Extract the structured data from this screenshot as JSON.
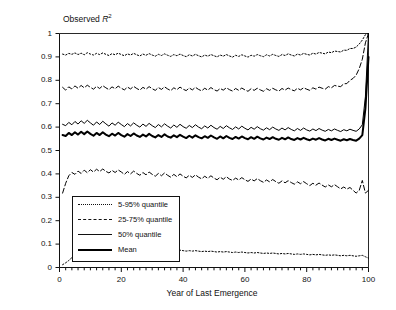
{
  "chart_data": {
    "type": "line",
    "title": "",
    "ylabel": "Observed R2",
    "ylabel_prefix": "Observed ",
    "ylabel_var": "R",
    "ylabel_exp": "2",
    "xlabel": "Year of Last Emergence",
    "xlim": [
      0,
      100
    ],
    "ylim": [
      0,
      1
    ],
    "xticks": [
      0,
      20,
      40,
      60,
      80,
      100
    ],
    "xtick_labels": [
      "0",
      "20",
      "40",
      "60",
      "80",
      "100"
    ],
    "yticks": [
      0,
      0.1,
      0.2,
      0.3,
      0.4,
      0.5,
      0.6,
      0.7,
      0.8,
      0.9,
      1
    ],
    "ytick_labels": [
      "0",
      "0.1",
      "0.2",
      "0.3",
      "0.4",
      "0.5",
      "0.6",
      "0.7",
      "0.8",
      "0.9",
      "1"
    ],
    "grid": false,
    "legend_position": "lower-left-inside",
    "legend": [
      {
        "label": "5-95% quantile",
        "style": "dotted",
        "width": 1
      },
      {
        "label": "25-75% quantile",
        "style": "dashed",
        "width": 1
      },
      {
        "label": "50% quantile",
        "style": "solid",
        "width": 1
      },
      {
        "label": "Mean",
        "style": "solid",
        "width": 2
      }
    ],
    "x": [
      1,
      2,
      3,
      4,
      5,
      6,
      7,
      8,
      9,
      10,
      11,
      12,
      13,
      14,
      15,
      16,
      17,
      18,
      19,
      20,
      21,
      22,
      23,
      24,
      25,
      26,
      27,
      28,
      29,
      30,
      31,
      32,
      33,
      34,
      35,
      36,
      37,
      38,
      39,
      40,
      41,
      42,
      43,
      44,
      45,
      46,
      47,
      48,
      49,
      50,
      51,
      52,
      53,
      54,
      55,
      56,
      57,
      58,
      59,
      60,
      61,
      62,
      63,
      64,
      65,
      66,
      67,
      68,
      69,
      70,
      71,
      72,
      73,
      74,
      75,
      76,
      77,
      78,
      79,
      80,
      81,
      82,
      83,
      84,
      85,
      86,
      87,
      88,
      89,
      90,
      91,
      92,
      93,
      94,
      95,
      96,
      97,
      98,
      99,
      100
    ],
    "series": [
      {
        "name": "95% quantile",
        "style": "dotted",
        "width": 1,
        "values": [
          0.912,
          0.908,
          0.915,
          0.911,
          0.917,
          0.91,
          0.916,
          0.909,
          0.918,
          0.912,
          0.908,
          0.915,
          0.91,
          0.917,
          0.911,
          0.906,
          0.914,
          0.909,
          0.916,
          0.91,
          0.905,
          0.913,
          0.908,
          0.915,
          0.909,
          0.904,
          0.912,
          0.907,
          0.914,
          0.908,
          0.903,
          0.911,
          0.906,
          0.913,
          0.907,
          0.902,
          0.91,
          0.905,
          0.912,
          0.906,
          0.901,
          0.909,
          0.904,
          0.911,
          0.905,
          0.9,
          0.908,
          0.903,
          0.91,
          0.905,
          0.9,
          0.908,
          0.903,
          0.91,
          0.904,
          0.899,
          0.907,
          0.902,
          0.909,
          0.904,
          0.899,
          0.907,
          0.903,
          0.91,
          0.905,
          0.901,
          0.909,
          0.904,
          0.911,
          0.906,
          0.902,
          0.91,
          0.906,
          0.913,
          0.908,
          0.904,
          0.912,
          0.908,
          0.915,
          0.911,
          0.908,
          0.916,
          0.912,
          0.919,
          0.916,
          0.913,
          0.921,
          0.918,
          0.925,
          0.923,
          0.921,
          0.929,
          0.928,
          0.936,
          0.936,
          0.942,
          0.955,
          0.972,
          0.995,
          1.0
        ]
      },
      {
        "name": "75% quantile",
        "style": "dashed",
        "width": 1,
        "values": [
          0.77,
          0.758,
          0.772,
          0.763,
          0.776,
          0.766,
          0.778,
          0.768,
          0.779,
          0.77,
          0.762,
          0.774,
          0.765,
          0.777,
          0.768,
          0.76,
          0.772,
          0.764,
          0.775,
          0.766,
          0.759,
          0.771,
          0.763,
          0.774,
          0.765,
          0.758,
          0.77,
          0.762,
          0.773,
          0.764,
          0.757,
          0.769,
          0.761,
          0.772,
          0.763,
          0.756,
          0.768,
          0.76,
          0.771,
          0.762,
          0.756,
          0.767,
          0.759,
          0.77,
          0.761,
          0.755,
          0.766,
          0.758,
          0.769,
          0.76,
          0.754,
          0.765,
          0.758,
          0.768,
          0.76,
          0.754,
          0.765,
          0.757,
          0.767,
          0.759,
          0.753,
          0.764,
          0.757,
          0.766,
          0.759,
          0.753,
          0.764,
          0.757,
          0.766,
          0.759,
          0.754,
          0.765,
          0.758,
          0.767,
          0.76,
          0.755,
          0.766,
          0.759,
          0.768,
          0.762,
          0.757,
          0.768,
          0.762,
          0.771,
          0.766,
          0.762,
          0.773,
          0.768,
          0.778,
          0.775,
          0.773,
          0.785,
          0.786,
          0.8,
          0.808,
          0.822,
          0.85,
          0.89,
          0.96,
          1.0
        ]
      },
      {
        "name": "50% quantile",
        "style": "solid",
        "width": 1,
        "values": [
          0.612,
          0.606,
          0.62,
          0.61,
          0.624,
          0.613,
          0.627,
          0.616,
          0.629,
          0.618,
          0.608,
          0.622,
          0.611,
          0.625,
          0.614,
          0.604,
          0.618,
          0.608,
          0.621,
          0.611,
          0.602,
          0.615,
          0.605,
          0.618,
          0.608,
          0.6,
          0.613,
          0.603,
          0.616,
          0.606,
          0.598,
          0.611,
          0.601,
          0.614,
          0.604,
          0.596,
          0.609,
          0.599,
          0.612,
          0.602,
          0.595,
          0.607,
          0.598,
          0.61,
          0.6,
          0.593,
          0.605,
          0.596,
          0.608,
          0.598,
          0.591,
          0.603,
          0.594,
          0.606,
          0.597,
          0.59,
          0.601,
          0.592,
          0.604,
          0.595,
          0.588,
          0.599,
          0.591,
          0.602,
          0.593,
          0.587,
          0.597,
          0.589,
          0.6,
          0.592,
          0.586,
          0.596,
          0.588,
          0.598,
          0.59,
          0.584,
          0.594,
          0.586,
          0.596,
          0.588,
          0.583,
          0.592,
          0.585,
          0.594,
          0.587,
          0.582,
          0.59,
          0.584,
          0.592,
          0.586,
          0.581,
          0.589,
          0.584,
          0.591,
          0.586,
          0.582,
          0.592,
          0.61,
          0.73,
          1.0
        ]
      },
      {
        "name": "Mean",
        "style": "solid",
        "width": 2,
        "values": [
          0.566,
          0.562,
          0.575,
          0.566,
          0.578,
          0.568,
          0.58,
          0.57,
          0.581,
          0.571,
          0.563,
          0.575,
          0.566,
          0.578,
          0.568,
          0.561,
          0.572,
          0.564,
          0.575,
          0.566,
          0.559,
          0.57,
          0.562,
          0.573,
          0.564,
          0.558,
          0.568,
          0.56,
          0.571,
          0.562,
          0.556,
          0.566,
          0.558,
          0.569,
          0.56,
          0.555,
          0.565,
          0.557,
          0.567,
          0.559,
          0.553,
          0.563,
          0.555,
          0.565,
          0.557,
          0.552,
          0.561,
          0.554,
          0.564,
          0.556,
          0.55,
          0.56,
          0.552,
          0.562,
          0.554,
          0.549,
          0.558,
          0.551,
          0.56,
          0.553,
          0.548,
          0.557,
          0.55,
          0.559,
          0.552,
          0.547,
          0.555,
          0.549,
          0.557,
          0.55,
          0.546,
          0.554,
          0.548,
          0.556,
          0.549,
          0.545,
          0.553,
          0.547,
          0.554,
          0.548,
          0.544,
          0.551,
          0.546,
          0.553,
          0.547,
          0.543,
          0.55,
          0.545,
          0.551,
          0.546,
          0.542,
          0.548,
          0.544,
          0.549,
          0.545,
          0.542,
          0.551,
          0.566,
          0.68,
          0.9
        ]
      },
      {
        "name": "25% quantile",
        "style": "dashed",
        "width": 1,
        "values": [
          0.318,
          0.36,
          0.392,
          0.406,
          0.398,
          0.412,
          0.402,
          0.416,
          0.405,
          0.418,
          0.408,
          0.42,
          0.41,
          0.421,
          0.411,
          0.404,
          0.415,
          0.406,
          0.417,
          0.408,
          0.398,
          0.41,
          0.4,
          0.412,
          0.402,
          0.394,
          0.406,
          0.396,
          0.408,
          0.398,
          0.39,
          0.402,
          0.392,
          0.404,
          0.394,
          0.386,
          0.398,
          0.388,
          0.4,
          0.39,
          0.383,
          0.394,
          0.385,
          0.396,
          0.386,
          0.379,
          0.39,
          0.381,
          0.392,
          0.382,
          0.375,
          0.386,
          0.377,
          0.388,
          0.378,
          0.372,
          0.382,
          0.374,
          0.384,
          0.375,
          0.368,
          0.378,
          0.37,
          0.38,
          0.371,
          0.364,
          0.374,
          0.366,
          0.376,
          0.367,
          0.36,
          0.37,
          0.362,
          0.371,
          0.363,
          0.356,
          0.366,
          0.358,
          0.367,
          0.358,
          0.35,
          0.36,
          0.352,
          0.361,
          0.352,
          0.344,
          0.353,
          0.345,
          0.354,
          0.345,
          0.336,
          0.344,
          0.335,
          0.342,
          0.33,
          0.318,
          0.33,
          0.372,
          0.318,
          0.33
        ]
      },
      {
        "name": "5% quantile",
        "style": "dotted",
        "width": 1,
        "values": [
          0.012,
          0.02,
          0.03,
          0.042,
          0.052,
          0.06,
          0.068,
          0.072,
          0.075,
          0.078,
          0.08,
          0.082,
          0.081,
          0.083,
          0.082,
          0.08,
          0.083,
          0.081,
          0.082,
          0.08,
          0.078,
          0.08,
          0.078,
          0.08,
          0.078,
          0.076,
          0.078,
          0.076,
          0.078,
          0.076,
          0.074,
          0.076,
          0.074,
          0.076,
          0.074,
          0.072,
          0.074,
          0.072,
          0.074,
          0.072,
          0.07,
          0.072,
          0.07,
          0.072,
          0.07,
          0.068,
          0.07,
          0.068,
          0.07,
          0.068,
          0.066,
          0.068,
          0.066,
          0.068,
          0.066,
          0.064,
          0.066,
          0.064,
          0.066,
          0.064,
          0.062,
          0.064,
          0.062,
          0.064,
          0.062,
          0.06,
          0.062,
          0.06,
          0.062,
          0.06,
          0.058,
          0.06,
          0.058,
          0.06,
          0.058,
          0.056,
          0.058,
          0.056,
          0.058,
          0.056,
          0.054,
          0.056,
          0.054,
          0.056,
          0.054,
          0.052,
          0.054,
          0.052,
          0.054,
          0.052,
          0.05,
          0.052,
          0.05,
          0.052,
          0.05,
          0.048,
          0.05,
          0.052,
          0.046,
          0.04
        ]
      }
    ]
  },
  "axes": {
    "ylabel_text": "Observed ",
    "xlabel_text": "Year of Last Emergence"
  }
}
